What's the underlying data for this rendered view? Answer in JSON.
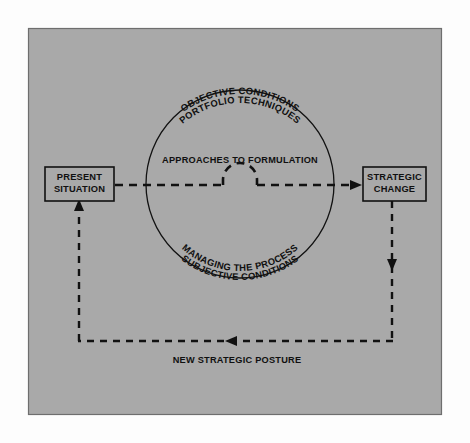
{
  "figure": {
    "panel_color": "#a9a9a9",
    "page_color": "#fdfdfd",
    "line_color": "#111111"
  },
  "nodes": {
    "present": {
      "line1": "PRESENT",
      "line2": "SITUATION"
    },
    "strategic_change": {
      "line1": "STRATEGIC",
      "line2": "CHANGE"
    }
  },
  "circle_labels": {
    "top_outer": "OBJECTIVE CONDITIONS",
    "top_inner": "PORTFOLIO TECHNIQUES",
    "center": "APPROACHES TO FORMULATION",
    "bottom_inner": "MANAGING THE PROCESS",
    "bottom_outer": "SUBJECTIVE CONDITIONS"
  },
  "flows": {
    "feedback_label": "NEW STRATEGIC POSTURE"
  }
}
